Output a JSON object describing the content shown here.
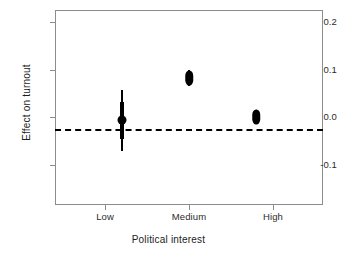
{
  "chart_data": {
    "type": "scatter",
    "title": "",
    "subtitle": "",
    "xlabel": "Political interest",
    "ylabel": "Effect on turnout",
    "categories": [
      "Low",
      "Medium",
      "High"
    ],
    "ytick_labels": [
      "0.2",
      "0.1",
      "0.0",
      "-0.1"
    ],
    "ytick_values": [
      0.2,
      0.1,
      0.0,
      -0.1
    ],
    "ylim": [
      -0.16,
      0.25
    ],
    "xlim": [
      0,
      4
    ],
    "grid": false,
    "legend": null,
    "reference_line": {
      "y": 0.0,
      "style": "dashed",
      "color": "#000000",
      "width": 2.6
    },
    "marker_color": "#000000",
    "axis_color": "#8c8c8c",
    "background": "#ffffff",
    "series": [
      {
        "name": "Effect on turnout",
        "points": [
          {
            "category": "Low",
            "x": 1,
            "estimate": 0.018,
            "inner_low": -0.021,
            "inner_high": 0.056,
            "outer_low": -0.046,
            "outer_high": 0.082,
            "marker": "circle"
          },
          {
            "category": "Medium",
            "x": 2,
            "estimate": 0.107,
            "inner_low": 0.096,
            "inner_high": 0.119,
            "outer_low": 0.091,
            "outer_high": 0.124,
            "marker": "lens"
          },
          {
            "category": "High",
            "x": 3,
            "estimate": 0.026,
            "inner_low": 0.018,
            "inner_high": 0.034,
            "outer_low": 0.015,
            "outer_high": 0.037,
            "marker": "lens"
          }
        ]
      }
    ]
  },
  "axis": {
    "ytick_0": "0.2",
    "ytick_1": "0.1",
    "ytick_2": "0.0",
    "ytick_3": "-0.1",
    "xtick_0": "Low",
    "xtick_1": "Medium",
    "xtick_2": "High",
    "xlabel": "Political interest",
    "ylabel": "Effect on turnout"
  }
}
